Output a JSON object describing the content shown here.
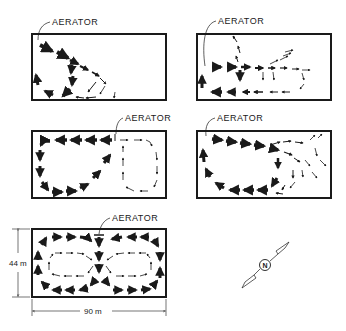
{
  "diagram": {
    "type": "aeration-pond-circulation-patterns",
    "panels": [
      {
        "id": "top-left",
        "aerator_label": "AERATOR",
        "aerator_position": "top-left corner",
        "pattern": "diagonal jet with single loop returning along left wall"
      },
      {
        "id": "top-right",
        "aerator_label": "AERATOR",
        "aerator_position": "left wall",
        "pattern": "horizontal jet splitting into upper fan and lower return loop"
      },
      {
        "id": "middle-left",
        "aerator_label": "AERATOR",
        "aerator_position": "top center",
        "pattern": "two counter-rotating loops, strong left loop, weak right loop"
      },
      {
        "id": "middle-right",
        "aerator_label": "AERATOR",
        "aerator_position": "top-left corner",
        "pattern": "jet along top wall, single large loop with diffuse right zone"
      },
      {
        "id": "bottom-left",
        "aerator_label": "AERATOR",
        "aerator_position": "top center",
        "pattern": "symmetric double-loop circulation with inner weak cells"
      }
    ],
    "dimensions": {
      "height_label": "44 m",
      "width_label": "90 m"
    },
    "compass": {
      "symbol": "N",
      "label": "north-arrow"
    },
    "colors": {
      "ink": "#1a1a1a",
      "background": "#ffffff"
    }
  }
}
